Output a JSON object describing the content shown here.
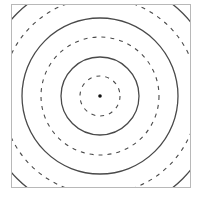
{
  "diagram": {
    "type": "concentric-circles",
    "center": {
      "x": 100,
      "y": 96
    },
    "center_dot_radius": 1.8,
    "frame": {
      "x": 11.5,
      "y": 4.5,
      "width": 179,
      "height": 183,
      "color": "#b8b8b8"
    },
    "line_color": "#4a4a4a",
    "circles": [
      {
        "r": 20,
        "style": "dashed"
      },
      {
        "r": 39,
        "style": "solid"
      },
      {
        "r": 59,
        "style": "dashed"
      },
      {
        "r": 78,
        "style": "solid"
      },
      {
        "r": 98,
        "style": "dashed"
      },
      {
        "r": 117,
        "style": "solid"
      }
    ]
  }
}
